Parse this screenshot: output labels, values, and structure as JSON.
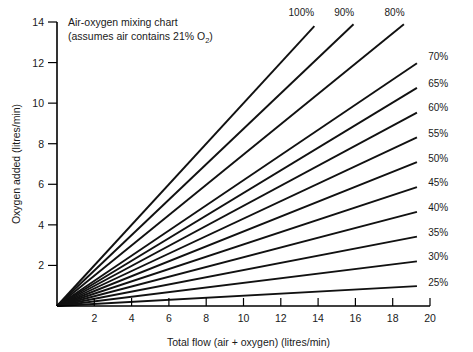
{
  "chart_data": {
    "type": "line",
    "title": "Air-oxygen mixing chart",
    "subtitle": "(assumes air contains 21% O₂)",
    "title_line1": "Air-oxygen mixing chart",
    "title_line2_pre": "(assumes air contains 21% O",
    "title_line2_sub": "2",
    "title_line2_post": ")",
    "xlabel": "Total flow (air + oxygen) (litres/min)",
    "ylabel": "Oxygen added (litres/min)",
    "xlim": [
      0,
      20
    ],
    "ylim": [
      0,
      14
    ],
    "xticks": [
      2,
      4,
      6,
      8,
      10,
      12,
      14,
      16,
      18,
      20
    ],
    "yticks": [
      2,
      4,
      6,
      8,
      10,
      12,
      14
    ],
    "xtick_labels": [
      "2",
      "4",
      "6",
      "8",
      "10",
      "12",
      "14",
      "16",
      "18",
      "20"
    ],
    "ytick_labels": [
      "2",
      "4",
      "6",
      "8",
      "10",
      "12",
      "14"
    ],
    "grid": false,
    "legend": "inline-end-labels",
    "relation": "oxygen_added = total_flow * (FiO2 - 21) / 79",
    "series": [
      {
        "name": "100%",
        "fio2": 100,
        "slope": 1.0,
        "x_end": 13.8,
        "y_end": 13.8,
        "label": "100%",
        "label_x": 13.1,
        "label_y": 14.6
      },
      {
        "name": "90%",
        "fio2": 90,
        "slope": 0.8734,
        "x_end": 15.9,
        "y_end": 13.89,
        "label": "90%",
        "label_x": 15.4,
        "label_y": 14.6
      },
      {
        "name": "80%",
        "fio2": 80,
        "slope": 0.7468,
        "x_end": 18.6,
        "y_end": 13.89,
        "label": "80%",
        "label_x": 18.1,
        "label_y": 14.6
      },
      {
        "name": "70%",
        "fio2": 70,
        "slope": 0.6203,
        "x_end": 19.3,
        "y_end": 11.97,
        "label": "70%",
        "label_x": 19.9,
        "label_y": 12.3
      },
      {
        "name": "65%",
        "fio2": 65,
        "slope": 0.557,
        "x_end": 19.3,
        "y_end": 10.75,
        "label": "65%",
        "label_x": 19.9,
        "label_y": 11.0
      },
      {
        "name": "60%",
        "fio2": 60,
        "slope": 0.4937,
        "x_end": 19.3,
        "y_end": 9.53,
        "label": "60%",
        "label_x": 19.9,
        "label_y": 9.8
      },
      {
        "name": "55%",
        "fio2": 55,
        "slope": 0.4304,
        "x_end": 19.3,
        "y_end": 8.31,
        "label": "55%",
        "label_x": 19.9,
        "label_y": 8.55
      },
      {
        "name": "50%",
        "fio2": 50,
        "slope": 0.3671,
        "x_end": 19.3,
        "y_end": 7.09,
        "label": "50%",
        "label_x": 19.9,
        "label_y": 7.3
      },
      {
        "name": "45%",
        "fio2": 45,
        "slope": 0.3038,
        "x_end": 19.3,
        "y_end": 5.86,
        "label": "45%",
        "label_x": 19.9,
        "label_y": 6.1
      },
      {
        "name": "40%",
        "fio2": 40,
        "slope": 0.2405,
        "x_end": 19.3,
        "y_end": 4.64,
        "label": "40%",
        "label_x": 19.9,
        "label_y": 4.9
      },
      {
        "name": "35%",
        "fio2": 35,
        "slope": 0.1772,
        "x_end": 19.3,
        "y_end": 3.42,
        "label": "35%",
        "label_x": 19.9,
        "label_y": 3.65
      },
      {
        "name": "30%",
        "fio2": 30,
        "slope": 0.1139,
        "x_end": 19.3,
        "y_end": 2.2,
        "label": "30%",
        "label_x": 19.9,
        "label_y": 2.45
      },
      {
        "name": "25%",
        "fio2": 25,
        "slope": 0.0506,
        "x_end": 19.3,
        "y_end": 0.98,
        "label": "25%",
        "label_x": 19.9,
        "label_y": 1.2
      }
    ]
  },
  "colors": {
    "line": "#111111",
    "axis": "#000000",
    "text": "#1a1a1a",
    "background": "#ffffff"
  }
}
